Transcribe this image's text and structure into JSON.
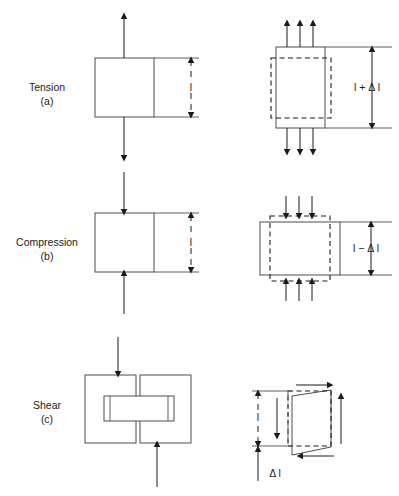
{
  "figure": {
    "background_color": "#ffffff",
    "line_color": "#1a1a1a",
    "body_stroke_color": "#4d4d4d"
  },
  "rows": [
    {
      "id": "tension",
      "name": "Tension",
      "label": "Tension",
      "sublabel": "(a)",
      "undeformed_dimension": "l",
      "deformed_dimension": "l + Δ l",
      "load_direction": "outward-vertical",
      "arrow_count_deformed": 3
    },
    {
      "id": "compression",
      "name": "Compression",
      "label": "Compression",
      "sublabel": "(b)",
      "undeformed_dimension": "l",
      "deformed_dimension": "l − Δ l",
      "load_direction": "inward-vertical",
      "arrow_count_deformed": 3
    },
    {
      "id": "shear",
      "name": "Shear",
      "label": "Shear",
      "sublabel": "(c)",
      "undeformed_dimension": "l",
      "deformed_dimension": "Δ l",
      "load_direction": "opposed-offset-vertical",
      "arrow_count_deformed": 2
    }
  ]
}
